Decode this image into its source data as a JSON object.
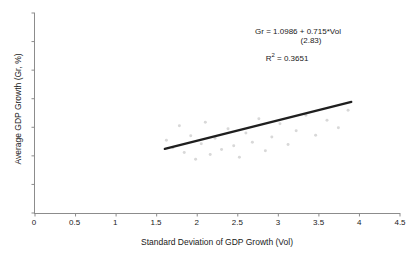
{
  "chart_data": {
    "type": "scatter",
    "title": "",
    "xlabel": "Standard Deviation of GDP Growth (Vol)",
    "ylabel": "Average GDP Growth (Gr, %)",
    "xlim": [
      0,
      4.5
    ],
    "ylim": [
      0,
      7
    ],
    "xticks": [
      "0",
      "0.5",
      "1",
      "1.5",
      "2",
      "2.5",
      "3",
      "3.5",
      "4",
      "4.5"
    ],
    "xtick_values": [
      0,
      0.5,
      1,
      1.5,
      2,
      2.5,
      3,
      3.5,
      4,
      4.5
    ],
    "yticks": [
      "0",
      "1",
      "2",
      "3",
      "4",
      "5",
      "6",
      "7"
    ],
    "ytick_values": [
      0,
      1,
      2,
      3,
      4,
      5,
      6,
      7
    ],
    "grid": false,
    "legend": "none",
    "series": [
      {
        "name": "Country observations",
        "type": "scatter",
        "marker_color": "#d8d8d8",
        "points": [
          [
            1.62,
            2.55
          ],
          [
            1.7,
            2.28
          ],
          [
            1.78,
            3.05
          ],
          [
            1.84,
            2.12
          ],
          [
            1.92,
            2.7
          ],
          [
            1.98,
            1.88
          ],
          [
            2.05,
            2.42
          ],
          [
            2.1,
            3.18
          ],
          [
            2.16,
            2.05
          ],
          [
            2.22,
            2.62
          ],
          [
            2.3,
            2.22
          ],
          [
            2.38,
            2.95
          ],
          [
            2.45,
            2.35
          ],
          [
            2.52,
            1.95
          ],
          [
            2.6,
            2.8
          ],
          [
            2.68,
            2.48
          ],
          [
            2.76,
            3.3
          ],
          [
            2.84,
            2.18
          ],
          [
            2.92,
            2.66
          ],
          [
            3.02,
            3.12
          ],
          [
            3.12,
            2.4
          ],
          [
            3.22,
            2.88
          ],
          [
            3.34,
            3.42
          ],
          [
            3.46,
            2.72
          ],
          [
            3.6,
            3.25
          ],
          [
            3.74,
            2.98
          ],
          [
            3.86,
            3.6
          ]
        ]
      },
      {
        "name": "Fitted regression line",
        "type": "line",
        "line_color": "#1f1f1f",
        "line_width": 2.2,
        "x_start": 1.6,
        "y_start": 2.2426,
        "x_end": 3.9,
        "y_end": 3.8871
      }
    ],
    "annotations": {
      "equation": "Gr = 1.0986 + 0.715*Vol",
      "std_error": "(2.83)",
      "r_squared_label": "R",
      "r_squared_exponent": "2",
      "r_squared_value": " = 0.3651",
      "intercept": 1.0986,
      "slope": 0.715,
      "t_statistic": 2.83,
      "r_squared": 0.3651
    },
    "colors": {
      "background": "#ffffff",
      "axis": "#8c8c8c",
      "text": "#1a1a1a",
      "fit_line": "#1f1f1f",
      "marker": "#d8d8d8"
    }
  }
}
